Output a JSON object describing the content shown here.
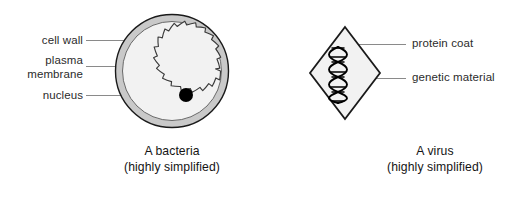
{
  "figure": {
    "background_color": "#ffffff"
  },
  "bacteria": {
    "caption_line1": "A bacteria",
    "caption_line2": "(highly simplified)",
    "labels": [
      {
        "id": "cell-wall",
        "text": "cell wall"
      },
      {
        "id": "plasma-membrane",
        "line1": "plasma",
        "line2": "membrane"
      },
      {
        "id": "nucleus",
        "text": "nucleus"
      }
    ],
    "colors": {
      "outline": "#1a1a1a",
      "cell_wall_fill": "#c9c9c9",
      "cytoplasm_fill": "#f2f2f2",
      "nucleus_fill": "#000000",
      "membrane_stroke": "#3d3d3d",
      "leader_line": "#8a8a8a"
    },
    "geometry": {
      "center_x": 172,
      "center_y": 71,
      "outer_radius": 57,
      "wall_thickness": 7,
      "nucleus_x": 186,
      "nucleus_y": 95,
      "nucleus_radius": 7
    }
  },
  "virus": {
    "caption_line1": "A virus",
    "caption_line2": "(highly simplified)",
    "labels": [
      {
        "id": "protein-coat",
        "text": "protein coat"
      },
      {
        "id": "genetic-material",
        "text": "genetic material"
      }
    ],
    "colors": {
      "outline": "#1a1a1a",
      "coat_fill": "#f2f2f2",
      "helix_stroke": "#000000",
      "leader_line": "#8a8a8a"
    },
    "geometry": {
      "center_x": 345,
      "center_y": 73,
      "half_width": 35,
      "half_height": 46,
      "helix_turns": 5
    }
  }
}
